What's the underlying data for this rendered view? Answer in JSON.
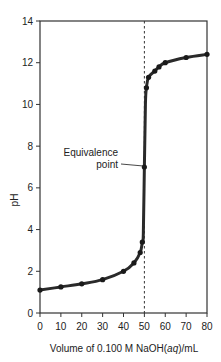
{
  "chart_data": {
    "type": "line",
    "title": "",
    "xlabel": "Volume of 0.100 M NaOH(aq)/mL",
    "xlabel_parts": [
      "Volume of 0.100 M NaOH(",
      "aq",
      ")/mL"
    ],
    "ylabel": "pH",
    "xlim": [
      0,
      80
    ],
    "ylim": [
      0,
      14
    ],
    "xticks": [
      0,
      10,
      20,
      30,
      40,
      50,
      60,
      70,
      80
    ],
    "yticks": [
      0,
      2,
      4,
      6,
      8,
      10,
      12,
      14
    ],
    "grid": false,
    "legend": null,
    "series": [
      {
        "name": "Titration curve",
        "x": [
          0,
          10,
          20,
          30,
          40,
          45,
          48,
          49,
          49.5,
          50,
          50.5,
          51,
          52,
          55,
          57,
          60,
          70,
          80
        ],
        "values": [
          1.1,
          1.25,
          1.4,
          1.6,
          2.0,
          2.4,
          2.9,
          3.4,
          3.8,
          7.0,
          10.0,
          10.8,
          11.3,
          11.6,
          11.8,
          12.0,
          12.25,
          12.4
        ]
      }
    ],
    "annotations": [
      {
        "text_line1": "Equivalence",
        "text_line2": "point",
        "x": 50,
        "y": 7.0
      }
    ],
    "reference_lines": [
      {
        "type": "vertical",
        "x": 50,
        "style": "dashed"
      }
    ]
  }
}
